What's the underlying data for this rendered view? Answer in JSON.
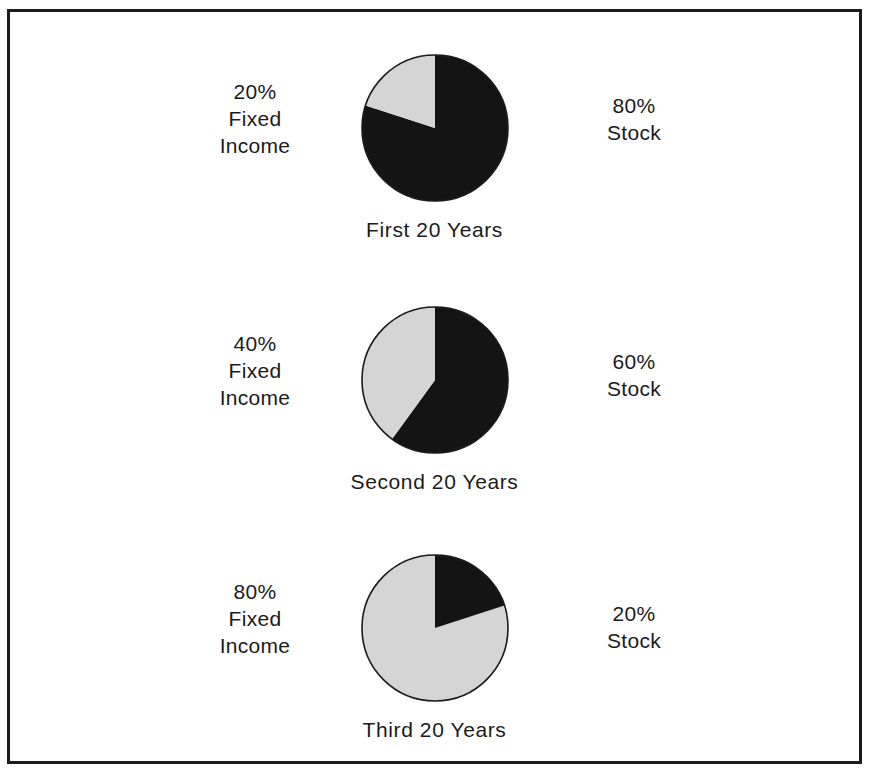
{
  "figure": {
    "top_caption": "",
    "frame_color": "#1b1b1b",
    "background": "#ffffff"
  },
  "colors": {
    "stock": "#141414",
    "fixed_income": "#d5d5d5",
    "outline": "#1b1b1b",
    "text": "#1b1b1b"
  },
  "chart_data": {
    "type": "pie",
    "title": "",
    "charts": [
      {
        "caption": "First 20 Years",
        "left_label": {
          "percent": "20%",
          "line2": "Fixed",
          "line3": "Income"
        },
        "right_label": {
          "percent": "80%",
          "line2": "Stock"
        },
        "categories": [
          "Stock",
          "Fixed Income"
        ],
        "values": [
          80,
          20
        ],
        "slice_colors": [
          "#141414",
          "#d5d5d5"
        ]
      },
      {
        "caption": "Second 20 Years",
        "left_label": {
          "percent": "40%",
          "line2": "Fixed",
          "line3": "Income"
        },
        "right_label": {
          "percent": "60%",
          "line2": "Stock"
        },
        "categories": [
          "Stock",
          "Fixed Income"
        ],
        "values": [
          60,
          40
        ],
        "slice_colors": [
          "#141414",
          "#d5d5d5"
        ]
      },
      {
        "caption": "Third 20 Years",
        "left_label": {
          "percent": "80%",
          "line2": "Fixed",
          "line3": "Income"
        },
        "right_label": {
          "percent": "20%",
          "line2": "Stock"
        },
        "categories": [
          "Stock",
          "Fixed Income"
        ],
        "values": [
          20,
          80
        ],
        "slice_colors": [
          "#141414",
          "#d5d5d5"
        ]
      }
    ],
    "legend": "none",
    "grid": false
  }
}
